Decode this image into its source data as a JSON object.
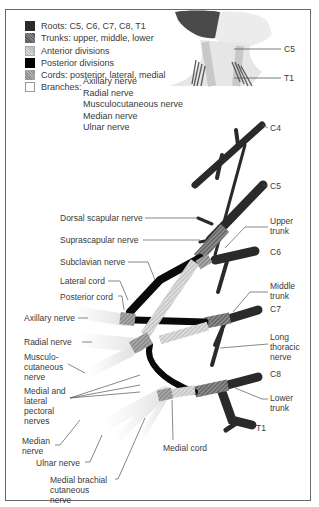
{
  "legend": {
    "items": [
      {
        "key": "roots",
        "label": "Roots: C5, C6, C7, C8, T1"
      },
      {
        "key": "trunks",
        "label": "Trunks: upper, middle, lower"
      },
      {
        "key": "anterior",
        "label": "Anterior divisions"
      },
      {
        "key": "posterior",
        "label": "Posterior divisions"
      },
      {
        "key": "cords",
        "label": "Cords: posterior, lateral, medial"
      },
      {
        "key": "branches",
        "label": "Branches:"
      }
    ],
    "branches": [
      "Axillary nerve",
      "Radial nerve",
      "Musculocutaneous nerve",
      "Median nerve",
      "Ulnar nerve"
    ]
  },
  "inset": {
    "labels": {
      "c5": "C5",
      "t1": "T1"
    }
  },
  "labels": {
    "c4": "C4",
    "c5": "C5",
    "c6": "C6",
    "c7": "C7",
    "c8": "C8",
    "t1": "T1",
    "upper_trunk": "Upper trunk",
    "middle_trunk": "Middle trunk",
    "lower_trunk": "Lower trunk",
    "long_thoracic": "Long thoracic nerve",
    "dorsal_scapular": "Dorsal scapular nerve",
    "suprascapular": "Suprascapular nerve",
    "subclavian": "Subclavian nerve",
    "lateral_cord": "Lateral cord",
    "posterior_cord": "Posterior cord",
    "axillary": "Axillary nerve",
    "radial": "Radial nerve",
    "musculocutaneous": "Musculo-cutaneous nerve",
    "pectoral": "Medial and lateral pectoral nerves",
    "median": "Median nerve",
    "ulnar": "Ulnar nerve",
    "medial_brachial": "Medial brachial cutaneous nerve",
    "medial_cord": "Medial cord"
  },
  "colors": {
    "roots": "#2a2a2a",
    "trunks": "#6e6e6e",
    "anterior": "#cfcfcf",
    "posterior": "#0a0a0a",
    "cords": "#9a9a9a",
    "branches": "#f2f2f2",
    "frame": "#6a6a6a"
  }
}
